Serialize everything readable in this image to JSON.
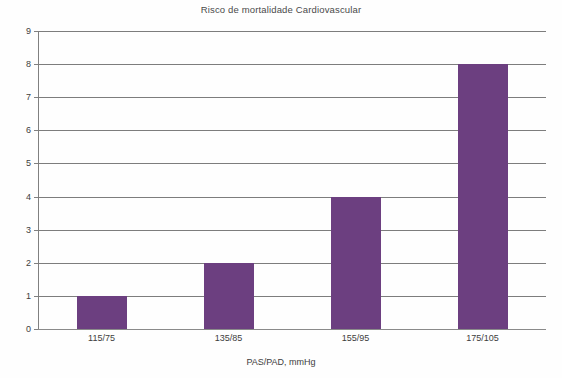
{
  "chart_data": {
    "type": "bar",
    "title": "Risco de mortalidade Cardiovascular",
    "xlabel": "PAS/PAD, mmHg",
    "ylabel": "",
    "categories": [
      "115/75",
      "135/85",
      "155/95",
      "175/105"
    ],
    "values": [
      1,
      2,
      4,
      8
    ],
    "ylim": [
      0,
      9
    ],
    "ytick_labels": [
      "0",
      "1",
      "2",
      "3",
      "4",
      "5",
      "6",
      "7",
      "8",
      "9"
    ],
    "ytick_values": [
      0,
      1,
      2,
      3,
      4,
      5,
      6,
      7,
      8,
      9
    ],
    "grid": true,
    "legend": null,
    "series": [
      {
        "name": "Risco de mortalidade Cardiovascular",
        "values": [
          1,
          2,
          4,
          8
        ],
        "color": "#6C3F80"
      }
    ],
    "colors": {
      "bar": "#6C3F80",
      "grid": "#7D7D7D",
      "axis": "#808080",
      "title_text": "#4A4A4A",
      "tick_text": "#3D3D3D",
      "background": "#FEFEFE"
    }
  }
}
